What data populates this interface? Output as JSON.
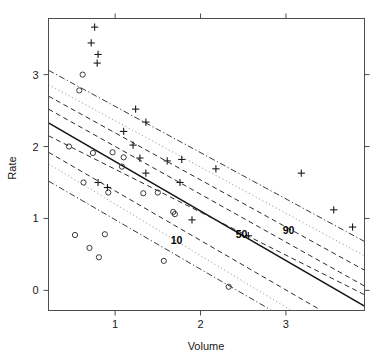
{
  "chart_data": {
    "type": "scatter",
    "title": "",
    "subtitle": "",
    "xlabel": "Volume",
    "ylabel": "Rate",
    "xlim": [
      0.22,
      3.92
    ],
    "ylim": [
      -0.28,
      3.78
    ],
    "xticks": [
      1,
      2,
      3
    ],
    "xtick_labels": [
      "1",
      "2",
      "3"
    ],
    "yticks": [
      0,
      1,
      2,
      3
    ],
    "ytick_labels": [
      "0",
      "1",
      "2",
      "3"
    ],
    "grid": false,
    "legend": "none",
    "frame": "box",
    "tick_sides": [
      "bottom",
      "left",
      "top",
      "right"
    ],
    "annotations": [
      {
        "text": "10",
        "x": 1.72,
        "y": 0.64,
        "bold": true
      },
      {
        "text": "50",
        "x": 2.48,
        "y": 0.73,
        "bold": true
      },
      {
        "text": "90",
        "x": 3.03,
        "y": 0.78,
        "bold": true
      }
    ],
    "series": [
      {
        "name": "plus-markers",
        "marker": "plus",
        "color": "#1a1a1a",
        "points": [
          [
            0.76,
            3.66
          ],
          [
            0.72,
            3.44
          ],
          [
            0.8,
            3.28
          ],
          [
            0.79,
            3.16
          ],
          [
            1.24,
            2.52
          ],
          [
            1.36,
            2.34
          ],
          [
            1.1,
            2.21
          ],
          [
            1.21,
            2.02
          ],
          [
            1.29,
            1.84
          ],
          [
            1.61,
            1.8
          ],
          [
            1.78,
            1.82
          ],
          [
            1.36,
            1.63
          ],
          [
            1.76,
            1.5
          ],
          [
            0.8,
            1.5
          ],
          [
            0.91,
            1.43
          ],
          [
            1.9,
            0.98
          ],
          [
            2.18,
            1.69
          ],
          [
            2.56,
            0.76
          ],
          [
            3.18,
            1.63
          ],
          [
            3.56,
            1.12
          ],
          [
            3.78,
            0.88
          ]
        ]
      },
      {
        "name": "circle-markers",
        "marker": "circle",
        "color": "#3a3a3a",
        "points": [
          [
            0.62,
            3.0
          ],
          [
            0.58,
            2.78
          ],
          [
            0.46,
            2.0
          ],
          [
            0.74,
            1.91
          ],
          [
            0.97,
            1.92
          ],
          [
            1.1,
            1.85
          ],
          [
            1.08,
            1.72
          ],
          [
            0.63,
            1.5
          ],
          [
            0.92,
            1.36
          ],
          [
            1.33,
            1.35
          ],
          [
            1.5,
            1.36
          ],
          [
            1.68,
            1.09
          ],
          [
            1.7,
            1.06
          ],
          [
            0.53,
            0.77
          ],
          [
            0.88,
            0.78
          ],
          [
            0.7,
            0.59
          ],
          [
            0.81,
            0.46
          ],
          [
            1.57,
            0.41
          ],
          [
            2.33,
            0.05
          ]
        ]
      }
    ],
    "quantile_lines": [
      {
        "name": "center-fit",
        "style": "solid",
        "label": "50",
        "x0": 0.22,
        "y0": 2.33,
        "x1": 3.92,
        "y1": -0.22
      },
      {
        "name": "band-50-lower",
        "style": "dashed",
        "label": "",
        "x0": 0.22,
        "y0": 2.15,
        "x1": 3.92,
        "y1": -0.06
      },
      {
        "name": "band-50-upper",
        "style": "dashed",
        "label": "",
        "x0": 0.22,
        "y0": 2.52,
        "x1": 3.92,
        "y1": 0.06
      },
      {
        "name": "band-10-dashed",
        "style": "dashed",
        "label": "10",
        "x0": 0.22,
        "y0": 1.92,
        "x1": 3.4,
        "y1": -0.27
      },
      {
        "name": "band-10-dotted",
        "style": "dotted",
        "label": "10",
        "x0": 0.22,
        "y0": 1.76,
        "x1": 3.05,
        "y1": -0.27
      },
      {
        "name": "band-10-dashdot",
        "style": "dashdot",
        "label": "10",
        "x0": 0.22,
        "y0": 1.52,
        "x1": 2.82,
        "y1": -0.27
      },
      {
        "name": "band-90-dashed",
        "style": "dashed",
        "label": "90",
        "x0": 0.22,
        "y0": 2.7,
        "x1": 3.92,
        "y1": 0.28
      },
      {
        "name": "band-90-dotted",
        "style": "dotted",
        "label": "90",
        "x0": 0.22,
        "y0": 2.86,
        "x1": 3.92,
        "y1": 0.48
      },
      {
        "name": "band-90-dashdot",
        "style": "dashdot",
        "label": "90",
        "x0": 0.22,
        "y0": 3.06,
        "x1": 3.92,
        "y1": 0.68
      }
    ]
  }
}
